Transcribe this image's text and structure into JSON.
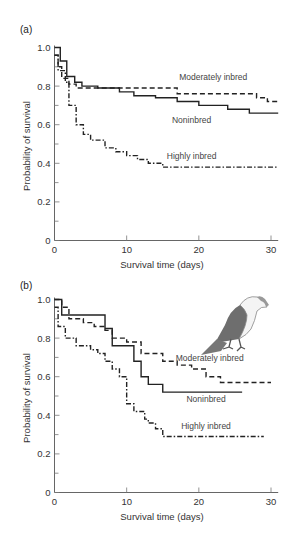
{
  "chart_data": [
    {
      "panel": "(a)",
      "type": "line",
      "step": true,
      "title": "",
      "xlabel": "Survival time (days)",
      "ylabel": "Probability of survival",
      "xlim": [
        0,
        31
      ],
      "ylim": [
        0,
        1.0
      ],
      "xticks": [
        0,
        10,
        20,
        30
      ],
      "yticks": [
        0,
        0.2,
        0.4,
        0.6,
        0.8,
        1.0
      ],
      "ytick_labels": [
        "0",
        "0.2",
        "0.4",
        "0.6",
        "0.8",
        "1.0"
      ],
      "grid": false,
      "series": [
        {
          "name": "Noninbred",
          "style": "solid",
          "x": [
            0,
            0.8,
            1.7,
            2.8,
            3.8,
            6,
            9,
            11,
            14,
            17,
            20,
            24,
            27,
            31
          ],
          "values": [
            1.0,
            0.93,
            0.85,
            0.82,
            0.8,
            0.79,
            0.77,
            0.75,
            0.74,
            0.72,
            0.7,
            0.68,
            0.66,
            0.66
          ]
        },
        {
          "name": "Moderately inbred",
          "style": "dashed",
          "x": [
            0,
            0.5,
            1,
            2,
            3,
            17,
            28,
            29.5,
            31
          ],
          "values": [
            0.96,
            0.9,
            0.84,
            0.81,
            0.79,
            0.76,
            0.74,
            0.72,
            0.72
          ]
        },
        {
          "name": "Highly inbred",
          "style": "dashdot",
          "x": [
            0,
            0.5,
            1.5,
            2,
            3,
            4,
            5,
            7,
            8.5,
            10,
            11.5,
            13,
            15,
            31
          ],
          "values": [
            0.96,
            0.88,
            0.82,
            0.7,
            0.6,
            0.55,
            0.52,
            0.48,
            0.46,
            0.44,
            0.42,
            0.4,
            0.38,
            0.38
          ]
        }
      ],
      "annotations": [
        {
          "text": "Moderately inbred",
          "x": 22,
          "y": 0.83
        },
        {
          "text": "Noninbred",
          "x": 19,
          "y": 0.61
        },
        {
          "text": "Highly inbred",
          "x": 19,
          "y": 0.42
        }
      ]
    },
    {
      "panel": "(b)",
      "type": "line",
      "step": true,
      "title": "",
      "xlabel": "Survival time (days)",
      "ylabel": "Probability of survival",
      "xlim": [
        0,
        31
      ],
      "ylim": [
        0,
        1.0
      ],
      "xticks": [
        0,
        10,
        20,
        30
      ],
      "yticks": [
        0,
        0.2,
        0.4,
        0.6,
        0.8,
        1.0
      ],
      "ytick_labels": [
        "0",
        "0.2",
        "0.4",
        "0.6",
        "0.8",
        "1.0"
      ],
      "grid": false,
      "series": [
        {
          "name": "Noninbred",
          "style": "solid",
          "x": [
            0,
            1,
            7,
            8,
            11,
            12,
            13,
            15,
            26
          ],
          "values": [
            1.0,
            0.92,
            0.85,
            0.76,
            0.68,
            0.6,
            0.56,
            0.52,
            0.52
          ]
        },
        {
          "name": "Moderately inbred",
          "style": "dashed",
          "x": [
            0,
            1,
            2,
            4,
            5.5,
            7,
            8,
            10,
            12,
            15,
            17,
            19,
            21,
            23,
            30
          ],
          "values": [
            1.0,
            0.96,
            0.9,
            0.88,
            0.86,
            0.84,
            0.8,
            0.78,
            0.72,
            0.68,
            0.66,
            0.64,
            0.6,
            0.57,
            0.57
          ]
        },
        {
          "name": "Highly inbred",
          "style": "dashdot",
          "x": [
            0,
            0.5,
            1.5,
            3,
            5,
            6,
            7,
            8,
            9,
            10,
            11,
            12.5,
            13,
            14,
            15,
            29
          ],
          "values": [
            0.96,
            0.86,
            0.8,
            0.76,
            0.74,
            0.72,
            0.68,
            0.64,
            0.6,
            0.46,
            0.42,
            0.38,
            0.36,
            0.33,
            0.29,
            0.29
          ]
        }
      ],
      "annotations": [
        {
          "text": "Moderately inbred",
          "x": 21.5,
          "y": 0.68
        },
        {
          "text": "Noninbred",
          "x": 21,
          "y": 0.47
        },
        {
          "text": "Highly inbred",
          "x": 21,
          "y": 0.33
        },
        {
          "text": "bird-illustration",
          "x": 26,
          "y": 0.85
        }
      ]
    }
  ],
  "figure": {
    "panel_a_label": "(a)",
    "panel_b_label": "(b)",
    "xlabel": "Survival time (days)",
    "ylabel": "Probability of survival",
    "ink_color": "#222222",
    "axis_color": "#666666",
    "bird_body_color": "#6e6e6e"
  }
}
